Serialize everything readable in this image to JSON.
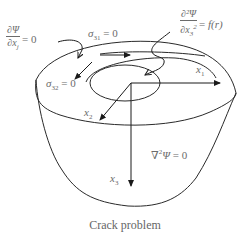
{
  "figure": {
    "caption": "Crack problem",
    "labels": {
      "bc_left": {
        "numerator": "∂Ψ",
        "denominator": "∂x",
        "den_sub": "j",
        "rhs": "= 0"
      },
      "sigma31": {
        "symbol": "σ",
        "sub": "31",
        "rhs": " = 0"
      },
      "bc_right": {
        "numerator": "∂²Ψ",
        "denominator": "∂x",
        "den_sub": "3",
        "den_sup": "2",
        "rhs_eq": "= ",
        "rhs_fn": "f(r)"
      },
      "sigma32": {
        "symbol": "σ",
        "sub": "32",
        "rhs": " = 0"
      },
      "x1": {
        "symbol": "x",
        "sub": "1"
      },
      "x2": {
        "symbol": "x",
        "sub": "2"
      },
      "x3": {
        "symbol": "x",
        "sub": "3"
      },
      "laplace": {
        "op": "∇",
        "sup": "2",
        "var": "Ψ",
        "rhs": " = 0"
      }
    },
    "colors": {
      "line": "#2a2a2a",
      "text": "#6b6b6b"
    }
  }
}
